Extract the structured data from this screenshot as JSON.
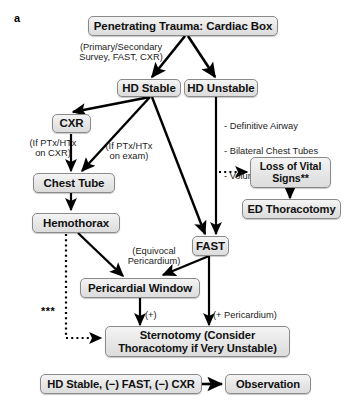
{
  "figure": {
    "panel_label": "a",
    "type": "clinical-algorithm-flowchart",
    "title": "Penetrating Trauma: Cardiac Box"
  },
  "nodes": {
    "root": {
      "label": "Penetrating Trauma: Cardiac Box"
    },
    "hd_stable": {
      "label": "HD Stable"
    },
    "hd_unstable": {
      "label": "HD Unstable"
    },
    "cxr": {
      "label": "CXR"
    },
    "chest_tube": {
      "label": "Chest Tube"
    },
    "hemothorax": {
      "label": "Hemothorax"
    },
    "fast": {
      "label": "FAST"
    },
    "pericardial_window": {
      "label": "Pericardial Window"
    },
    "loss_vital_signs": {
      "label": "Loss of Vital\nSigns**"
    },
    "ed_thoracotomy": {
      "label": "ED Thoracotomy"
    },
    "sternotomy": {
      "label": "Sternotomy (Consider\nThoracotomy if Very Unstable)"
    },
    "hd_stable_neg": {
      "label": "HD Stable, (−) FAST, (−) CXR"
    },
    "observation": {
      "label": "Observation"
    }
  },
  "annotations": {
    "primary_survey": "(Primary/Secondary\nSurvey, FAST, CXR)",
    "ptx_on_cxr": "(If PTx/HTx\non CXR)",
    "ptx_on_exam": "(If PTx/HTx\non exam)",
    "equivocal_pericardium": "(Equivocal\nPericardium)",
    "positive": "(+)",
    "positive_pericardium": "(+ Pericardium)",
    "triple_asterisk": "***"
  },
  "unstable_management": {
    "items": [
      "- Definitive Airway",
      "- Bilateral Chest Tubes",
      "- Volume Resuscitation*"
    ]
  },
  "colors": {
    "node_fill": "#e6e6e6",
    "node_border": "#8a8a8a",
    "edge": "#000000",
    "text": "#111111",
    "background": "#ffffff"
  }
}
